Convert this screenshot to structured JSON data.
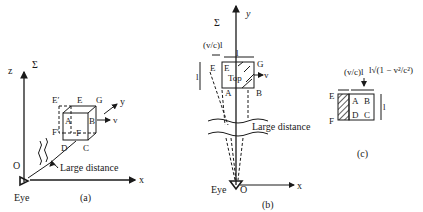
{
  "panel_a": {
    "caption": "(a)",
    "axis_z": "z",
    "frame": "Σ",
    "axis_y": "y",
    "axis_x": "x",
    "origin": "O",
    "eye": "Eye",
    "vertex_E_prime": "E′",
    "vertex_E": "E",
    "vertex_G": "G",
    "vertex_A": "A",
    "vertex_B": "B",
    "vertex_F_prime": "F′",
    "vertex_F": "F",
    "vertex_D": "D",
    "vertex_C": "C",
    "velocity": "v",
    "distance_label": "Large distance"
  },
  "panel_b": {
    "caption": "(b)",
    "frame": "Σ",
    "axis_y": "y",
    "axis_x": "x",
    "origin": "O",
    "eye": "Eye",
    "offset_label": "(v/c)l",
    "length_top": "l",
    "length_side": "l",
    "vertex_E_left": "E",
    "vertex_E": "E",
    "vertex_G": "G",
    "top_label": "Top",
    "vertex_A": "A",
    "vertex_B": "B",
    "velocity": "v",
    "distance_label": "Large distance"
  },
  "panel_c": {
    "caption": "(c)",
    "offset_label": "(v/c)l",
    "contracted_label": "l√(1 − v²/c²)",
    "vertex_E": "E",
    "vertex_F": "F",
    "vertex_A": "A",
    "vertex_B": "B",
    "vertex_D": "D",
    "vertex_C": "C",
    "length_side": "l"
  }
}
